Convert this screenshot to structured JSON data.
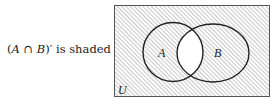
{
  "caption": {
    "set_a": "A",
    "operator": "∩",
    "set_b": "B",
    "suffix": "′ is shaded",
    "open_paren": "(",
    "close_paren": ")"
  },
  "diagram": {
    "universe_label": "U",
    "set_a_label": "A",
    "set_b_label": "B",
    "shaded_region": "complement of A ∩ B",
    "stroke_color": "#222222",
    "hatch_color": "#9a9a9a",
    "background": "#ffffff"
  }
}
